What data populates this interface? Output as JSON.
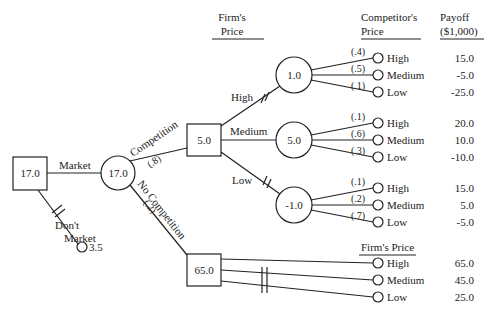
{
  "headers": {
    "firms_price": [
      "Firm's",
      "Price"
    ],
    "competitors_price": [
      "Competitor's",
      "Price"
    ],
    "payoff": [
      "Payoff",
      "($1,000)"
    ],
    "firms_price_bottom": "Firm's Price"
  },
  "root": {
    "value": "17.0",
    "type": "decision"
  },
  "branches": {
    "market": "Market",
    "dont_market": [
      "Don't",
      "Market"
    ],
    "dont_market_payoff": "3.5",
    "competition": "Competition",
    "competition_prob": "(.8)",
    "no_competition": "No Competition",
    "no_competition_prob": "(.2)"
  },
  "market_node": {
    "value": "17.0",
    "type": "chance"
  },
  "competition_node": {
    "value": "5.0",
    "type": "decision"
  },
  "no_competition_node": {
    "value": "65.0",
    "type": "decision"
  },
  "firm_price_branches": [
    {
      "label": "High",
      "node_value": "1.0",
      "blocked": true,
      "outcomes": [
        {
          "prob": "(.4)",
          "label": "High",
          "payoff": "15.0"
        },
        {
          "prob": "(.5)",
          "label": "Medium",
          "payoff": "-5.0"
        },
        {
          "prob": "(.1)",
          "label": "Low",
          "payoff": "-25.0"
        }
      ]
    },
    {
      "label": "Medium",
      "node_value": "5.0",
      "blocked": false,
      "outcomes": [
        {
          "prob": "(.1)",
          "label": "High",
          "payoff": "20.0"
        },
        {
          "prob": "(.6)",
          "label": "Medium",
          "payoff": "10.0"
        },
        {
          "prob": "(.3)",
          "label": "Low",
          "payoff": "-10.0"
        }
      ]
    },
    {
      "label": "Low",
      "node_value": "-1.0",
      "blocked": true,
      "outcomes": [
        {
          "prob": "(.1)",
          "label": "High",
          "payoff": "15.0"
        },
        {
          "prob": "(.2)",
          "label": "Medium",
          "payoff": "5.0"
        },
        {
          "prob": "(.7)",
          "label": "Low",
          "payoff": "-5.0"
        }
      ]
    }
  ],
  "no_competition_outcomes": [
    {
      "label": "High",
      "payoff": "65.0",
      "blocked": false
    },
    {
      "label": "Medium",
      "payoff": "45.0",
      "blocked": true
    },
    {
      "label": "Low",
      "payoff": "25.0",
      "blocked": true
    }
  ]
}
